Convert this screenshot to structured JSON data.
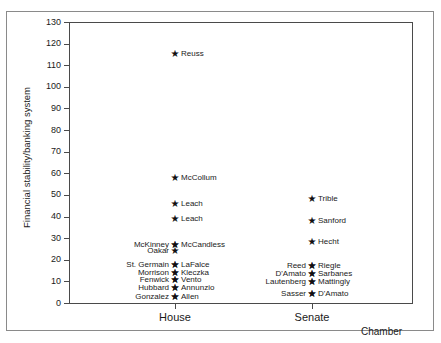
{
  "chart_data": {
    "type": "scatter",
    "title": "",
    "xlabel": "Chamber",
    "ylabel": "Financial stability/banking system",
    "categories": [
      "House",
      "Senate"
    ],
    "ylim": [
      0,
      130
    ],
    "yticks": [
      0,
      10,
      20,
      30,
      40,
      50,
      60,
      70,
      80,
      90,
      100,
      110,
      120,
      130
    ],
    "ytick_labels": [
      "0",
      "10",
      "20",
      "30",
      "40",
      "50",
      "60",
      "70",
      "80",
      "90",
      "100",
      "110",
      "120",
      "130"
    ],
    "grid": false,
    "legend": "none",
    "marker": "star",
    "marker_color": "#111111",
    "points": [
      {
        "chamber": "House",
        "label": "Reuss",
        "label_side": "right",
        "value": 115
      },
      {
        "chamber": "House",
        "label": "McCollum",
        "label_side": "right",
        "value": 58
      },
      {
        "chamber": "House",
        "label": "Leach",
        "label_side": "right",
        "value": 46
      },
      {
        "chamber": "House",
        "label": "Leach",
        "label_side": "right",
        "value": 39
      },
      {
        "chamber": "House",
        "label": "McCandless",
        "label_side": "right",
        "value": 27
      },
      {
        "chamber": "House",
        "label": "McKinney",
        "label_side": "left",
        "value": 27
      },
      {
        "chamber": "House",
        "label": "Oakar",
        "label_side": "left",
        "value": 24
      },
      {
        "chamber": "House",
        "label": "LaFalce",
        "label_side": "right",
        "value": 17.5
      },
      {
        "chamber": "House",
        "label": "St. Germain",
        "label_side": "left",
        "value": 17.5
      },
      {
        "chamber": "House",
        "label": "Kleczka",
        "label_side": "right",
        "value": 14
      },
      {
        "chamber": "House",
        "label": "Morrison",
        "label_side": "left",
        "value": 14
      },
      {
        "chamber": "House",
        "label": "Vento",
        "label_side": "right",
        "value": 10.5
      },
      {
        "chamber": "House",
        "label": "Fenwick",
        "label_side": "left",
        "value": 10.5
      },
      {
        "chamber": "House",
        "label": "Annunzio",
        "label_side": "right",
        "value": 7
      },
      {
        "chamber": "House",
        "label": "Hubbard",
        "label_side": "left",
        "value": 7
      },
      {
        "chamber": "House",
        "label": "Allen",
        "label_side": "right",
        "value": 3
      },
      {
        "chamber": "House",
        "label": "Gonzalez",
        "label_side": "left",
        "value": 3
      },
      {
        "chamber": "Senate",
        "label": "Trible",
        "label_side": "right",
        "value": 48
      },
      {
        "chamber": "Senate",
        "label": "Sanford",
        "label_side": "right",
        "value": 38
      },
      {
        "chamber": "Senate",
        "label": "Hecht",
        "label_side": "right",
        "value": 28
      },
      {
        "chamber": "Senate",
        "label": "Riegle",
        "label_side": "right",
        "value": 17
      },
      {
        "chamber": "Senate",
        "label": "Reed",
        "label_side": "left",
        "value": 17
      },
      {
        "chamber": "Senate",
        "label": "Sarbanes",
        "label_side": "right",
        "value": 13.5
      },
      {
        "chamber": "Senate",
        "label": "D'Amato",
        "label_side": "left",
        "value": 13.5
      },
      {
        "chamber": "Senate",
        "label": "Mattingly",
        "label_side": "right",
        "value": 9.5
      },
      {
        "chamber": "Senate",
        "label": "Lautenberg",
        "label_side": "left",
        "value": 9.5
      },
      {
        "chamber": "Senate",
        "label": "D'Amato",
        "label_side": "right",
        "value": 4
      },
      {
        "chamber": "Senate",
        "label": "Sasser",
        "label_side": "left",
        "value": 4
      }
    ]
  },
  "axes": {
    "ylabel": "Financial stability/banking system",
    "xlabel": "Chamber",
    "ytick_labels": [
      "130",
      "120",
      "110",
      "100",
      "90",
      "80",
      "70",
      "60",
      "50",
      "40",
      "30",
      "20",
      "10",
      "0"
    ],
    "xtick_labels": [
      "House",
      "Senate"
    ]
  }
}
